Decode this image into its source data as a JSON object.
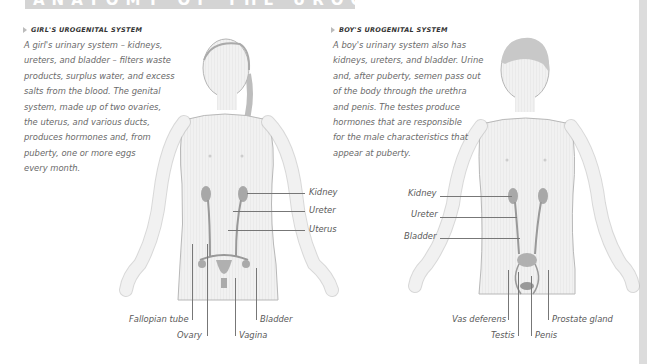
{
  "page": {
    "title": "ANATOMY OF THE UROGENITAL SYSTEM"
  },
  "girl": {
    "heading": "GIRL'S UROGENITAL SYSTEM",
    "text_lines": [
      "A girl's urinary system – kidneys,",
      "ureters, and bladder – filters waste",
      "products, surplus water, and excess",
      "salts from the blood. The genital",
      "system, made up of two ovaries,",
      "the uterus, and various ducts,",
      "produces hormones and, from",
      "puberty, one or more eggs",
      "every month."
    ],
    "labels": {
      "kidney": "Kidney",
      "ureter": "Ureter",
      "uterus": "Uterus",
      "fallopian_tube": "Fallopian tube",
      "ovary": "Ovary",
      "vagina": "Vagina",
      "bladder": "Bladder"
    }
  },
  "boy": {
    "heading": "BOY'S UROGENITAL SYSTEM",
    "text_lines": [
      "A boy's urinary system also has",
      "kidneys, ureters, and bladder. Urine",
      "and, after puberty, semen pass out",
      "of the body through the urethra",
      "and penis. The testes produce",
      "hormones that are responsible",
      "for the male characteristics that",
      "appear at puberty."
    ],
    "labels": {
      "kidney": "Kidney",
      "ureter": "Ureter",
      "bladder": "Bladder",
      "vas_deferens": "Vas deferens",
      "testis": "Testis",
      "penis": "Penis",
      "prostate_gland": "Prostate gland"
    }
  },
  "colors": {
    "title_band": "#d4d4d4",
    "skin": "#f0f0f0",
    "outline": "#b8b8b8",
    "organ": "#a8a8a8",
    "leader_line": "#777777"
  }
}
